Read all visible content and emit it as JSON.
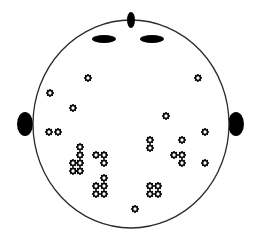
{
  "diagram": {
    "type": "head-topography-electrode-map",
    "colors": {
      "background": "#ffffff",
      "outline": "#2a2a2a",
      "features": "#000000",
      "marker": "#000000"
    },
    "head": {
      "cx": 131,
      "cy": 124,
      "rx": 98,
      "ry": 104
    },
    "nose": {
      "cx": 131,
      "cy": 20,
      "rx": 4,
      "ry": 8
    },
    "eyes": [
      {
        "cx": 104,
        "cy": 39,
        "rx": 12,
        "ry": 4
      },
      {
        "cx": 152,
        "cy": 39,
        "rx": 12,
        "ry": 4
      }
    ],
    "ears": [
      {
        "cx": 25,
        "cy": 124,
        "rx": 8,
        "ry": 12
      },
      {
        "cx": 236,
        "cy": 124,
        "rx": 8,
        "ry": 12
      }
    ],
    "markers": [
      {
        "x": 88,
        "y": 78
      },
      {
        "x": 198,
        "y": 78
      },
      {
        "x": 50,
        "y": 93
      },
      {
        "x": 73,
        "y": 108
      },
      {
        "x": 166,
        "y": 116
      },
      {
        "x": 49,
        "y": 132
      },
      {
        "x": 58,
        "y": 132
      },
      {
        "x": 205,
        "y": 132
      },
      {
        "x": 150,
        "y": 140
      },
      {
        "x": 182,
        "y": 140
      },
      {
        "x": 80,
        "y": 147
      },
      {
        "x": 150,
        "y": 148
      },
      {
        "x": 80,
        "y": 155
      },
      {
        "x": 96,
        "y": 155
      },
      {
        "x": 104,
        "y": 155
      },
      {
        "x": 174,
        "y": 155
      },
      {
        "x": 182,
        "y": 155
      },
      {
        "x": 73,
        "y": 163
      },
      {
        "x": 80,
        "y": 163
      },
      {
        "x": 104,
        "y": 163
      },
      {
        "x": 182,
        "y": 163
      },
      {
        "x": 205,
        "y": 163
      },
      {
        "x": 73,
        "y": 171
      },
      {
        "x": 80,
        "y": 171
      },
      {
        "x": 104,
        "y": 178
      },
      {
        "x": 96,
        "y": 186
      },
      {
        "x": 104,
        "y": 186
      },
      {
        "x": 150,
        "y": 186
      },
      {
        "x": 158,
        "y": 186
      },
      {
        "x": 96,
        "y": 194
      },
      {
        "x": 104,
        "y": 194
      },
      {
        "x": 150,
        "y": 194
      },
      {
        "x": 158,
        "y": 194
      },
      {
        "x": 135,
        "y": 209
      }
    ],
    "marker_icon": "gear-flower-icon"
  }
}
